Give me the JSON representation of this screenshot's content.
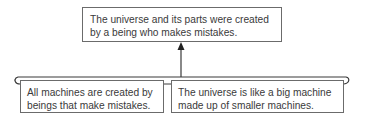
{
  "diagram": {
    "conclusion": {
      "lines": [
        "The universe and its parts were created",
        "by a being who makes mistakes."
      ]
    },
    "premises": [
      {
        "lines": [
          "All machines are created by",
          "beings that make mistakes."
        ]
      },
      {
        "lines": [
          "The universe is like a big machine",
          "made up of smaller machines."
        ]
      }
    ],
    "connector": "bracket-with-arrow-up",
    "colors": {
      "line": "#3a3a3a",
      "border": "#6b6b6b",
      "text": "#3a3a3a"
    }
  }
}
